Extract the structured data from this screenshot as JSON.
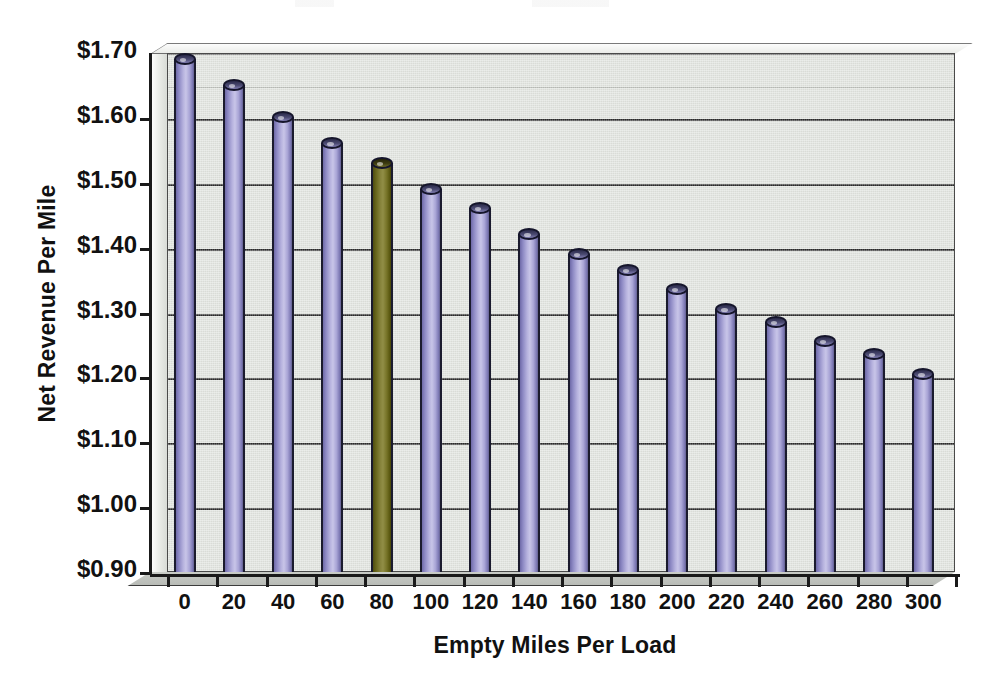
{
  "chart_data": {
    "type": "bar",
    "title": "",
    "xlabel": "Empty Miles Per Load",
    "ylabel": "Net Revenue Per Mile",
    "categories": [
      "0",
      "20",
      "40",
      "60",
      "80",
      "100",
      "120",
      "140",
      "160",
      "180",
      "200",
      "220",
      "240",
      "260",
      "280",
      "300"
    ],
    "values": [
      1.7,
      1.66,
      1.61,
      1.57,
      1.54,
      1.5,
      1.47,
      1.43,
      1.4,
      1.375,
      1.345,
      1.315,
      1.295,
      1.265,
      1.245,
      1.215
    ],
    "value_labels": [
      "$1.70",
      "$1.66",
      "$1.61",
      "$1.57",
      "$1.54",
      "$1.50",
      "$1.47",
      "$1.43",
      "$1.40",
      "$1.38",
      "$1.35",
      "$1.32",
      "$1.30",
      "$1.27",
      "$1.25",
      "$1.22"
    ],
    "ylim": [
      0.9,
      1.7
    ],
    "ytick_values": [
      0.9,
      1.0,
      1.1,
      1.2,
      1.3,
      1.4,
      1.5,
      1.6,
      1.7
    ],
    "ytick_labels": [
      "$0.90",
      "$1.00",
      "$1.10",
      "$1.20",
      "$1.30",
      "$1.40",
      "$1.50",
      "$1.60",
      "$1.70"
    ],
    "grid": true,
    "legend": false,
    "highlight_index": 4,
    "series_colors": {
      "default": "#b0ace0",
      "highlight": "#6e6b22",
      "plot_background": "#dfe2dd",
      "gridline": "#2c2c2c",
      "axis": "#1a1a1a",
      "text": "#111111"
    },
    "bar_style": "3d-cylinder",
    "annotations": []
  },
  "axes": {
    "y_title": "Net Revenue Per Mile",
    "x_title": "Empty Miles Per Load"
  }
}
